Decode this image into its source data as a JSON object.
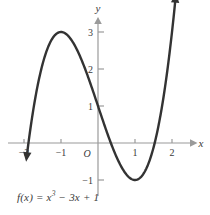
{
  "chart_data": {
    "type": "line",
    "title": "",
    "subtitle": "",
    "function_label": "f(x) = x",
    "function_exponent": "3",
    "function_tail": " − 3x + 1",
    "expression": "f(x) = x^3 - 3x + 1",
    "xlabel": "x",
    "ylabel": "y",
    "origin_label": "O",
    "xlim": [
      -2.2,
      2.35
    ],
    "ylim": [
      -1.55,
      3.6
    ],
    "xticks": [
      -2,
      -1,
      1,
      2
    ],
    "xtick_labels": [
      "−2",
      "−1",
      "1",
      "2"
    ],
    "yticks": [
      1,
      2,
      3,
      -1
    ],
    "ytick_labels": [
      "1",
      "2",
      "3",
      "−1"
    ],
    "grid": false,
    "legend": "none",
    "axis_arrows": [
      "x-positive",
      "y-positive"
    ],
    "curve_arrows": [
      "lower-left",
      "upper-right"
    ],
    "annotations": [
      {
        "name": "local-maximum",
        "x": -1,
        "y": 3
      },
      {
        "name": "local-minimum",
        "x": 1,
        "y": -1
      },
      {
        "name": "y-intercept",
        "x": 0,
        "y": 1
      },
      {
        "name": "x-intercept-left",
        "x": -1.879,
        "y": 0
      },
      {
        "name": "x-intercept-middle",
        "x": 0.347,
        "y": 0
      },
      {
        "name": "x-intercept-right",
        "x": 1.532,
        "y": 0
      }
    ],
    "x": [
      -2.05,
      -1.95,
      -1.85,
      -1.75,
      -1.65,
      -1.55,
      -1.45,
      -1.35,
      -1.25,
      -1.15,
      -1.05,
      -0.95,
      -0.85,
      -0.75,
      -0.65,
      -0.55,
      -0.45,
      -0.35,
      -0.25,
      -0.15,
      -0.05,
      0.05,
      0.15,
      0.25,
      0.35,
      0.45,
      0.55,
      0.65,
      0.75,
      0.85,
      0.95,
      1.05,
      1.15,
      1.25,
      1.35,
      1.45,
      1.55,
      1.65,
      1.75,
      1.85,
      1.95,
      2.05,
      2.12
    ],
    "y": [
      -1.46,
      -0.27,
      0.22,
      1.89,
      1.46,
      1.93,
      2.3,
      2.59,
      2.8,
      2.93,
      3.0,
      3.0,
      2.94,
      2.83,
      2.68,
      2.48,
      2.26,
      2.01,
      1.73,
      1.45,
      1.15,
      0.85,
      0.55,
      0.26,
      -0.01,
      -0.26,
      -0.48,
      -0.68,
      -0.83,
      -0.94,
      -1.0,
      -1.0,
      -0.93,
      -0.8,
      -0.59,
      -0.3,
      0.07,
      0.54,
      1.11,
      1.78,
      2.57,
      3.47,
      4.17
    ]
  },
  "styles": {
    "curve_color": "#333333",
    "axis_color": "#9a9a9a",
    "text_color": "#3a3a3a",
    "background": "#ffffff"
  }
}
